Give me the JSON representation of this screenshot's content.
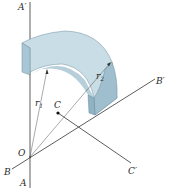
{
  "diagram": {
    "labels": {
      "a_prime": "A′",
      "a": "A",
      "b_prime": "B′",
      "b": "B",
      "c": "C",
      "c_prime": "C′",
      "o": "O",
      "r1_main": "r",
      "r1_sub": "1",
      "r2_main": "r",
      "r2_sub": "2"
    },
    "colors": {
      "line": "#333333",
      "solid_top": "#c9dde6",
      "solid_front": "#a9c6d4",
      "solid_side": "#8fb3c4",
      "solid_inner": "#b6cfdb"
    }
  }
}
